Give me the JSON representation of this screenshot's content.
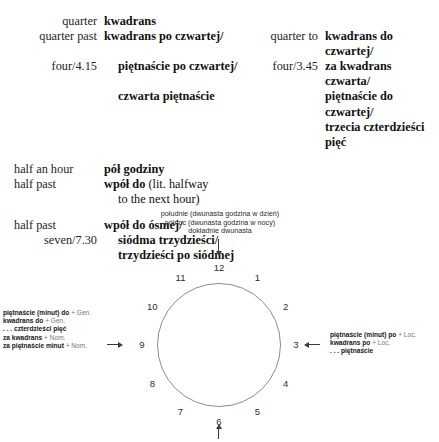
{
  "glossary": {
    "rows": [
      {
        "en_left": "quarter",
        "pl_left": "kwadrans",
        "en_right": "",
        "pl_right": ""
      },
      {
        "en_left": "quarter past",
        "pl_left": "kwadrans po czwartej/",
        "en_right": "quarter to",
        "pl_right": "kwadrans do czwartej/"
      },
      {
        "en_left": "four/4.15",
        "pl_left": "piętnaście po czwartej/",
        "en_right": "four/3.45",
        "pl_right": "za kwadrans czwarta/"
      },
      {
        "en_left": "",
        "pl_left": "czwarta piętnaście",
        "en_right": "",
        "pl_right": "piętnaście do czwartej/"
      },
      {
        "en_left": "",
        "pl_left": "",
        "en_right": "",
        "pl_right": "trzecia czterdzieści pięć"
      }
    ],
    "half_rows": [
      {
        "en": "half an hour",
        "pl": "pół godziny",
        "lit": ""
      },
      {
        "en": "half past",
        "pl": "wpół do ",
        "lit": "(lit. halfway"
      },
      {
        "en": "",
        "pl": "",
        "lit": "to the next hour)"
      }
    ],
    "seven_rows": [
      {
        "en": "half past",
        "pl": "wpół do ósmej/"
      },
      {
        "en": "seven/7.30",
        "pl": "siódma trzydzieści/"
      },
      {
        "en": "",
        "pl": "trzydzieści po siódmej"
      }
    ]
  },
  "diagram": {
    "noon_label": [
      "południe (dwunasta godzina w dzień)",
      "północ (dwunasta godzina w nocy)",
      "dokładnie dwunasta"
    ],
    "numerals": [
      {
        "label": "12",
        "angle": 0
      },
      {
        "label": "1",
        "angle": 30
      },
      {
        "label": "2",
        "angle": 60
      },
      {
        "label": "3",
        "angle": 90
      },
      {
        "label": "4",
        "angle": 120
      },
      {
        "label": "5",
        "angle": 150
      },
      {
        "label": "6",
        "angle": 180
      },
      {
        "label": "7",
        "angle": 210
      },
      {
        "label": "8",
        "angle": 240
      },
      {
        "label": "9",
        "angle": 270
      },
      {
        "label": "10",
        "angle": 300
      },
      {
        "label": "11",
        "angle": 330
      }
    ],
    "left_annotation": [
      {
        "bold": "piętnaście (minut) do",
        "rest": " + Gen."
      },
      {
        "bold": "kwadrans do",
        "rest": " + Gen."
      },
      {
        "bold": ". . . czterdzieści pięć",
        "rest": ""
      },
      {
        "bold": "za kwadrans",
        "rest": " + Nom."
      },
      {
        "bold": "za piętnaście minut",
        "rest": " + Nom."
      }
    ],
    "right_annotation": [
      {
        "bold": "piętnaście (minut) po",
        "rest": " + Loc."
      },
      {
        "bold": "kwadrans po",
        "rest": " + Loc."
      },
      {
        "bold": ". . . piętnaście",
        "rest": ""
      }
    ]
  }
}
